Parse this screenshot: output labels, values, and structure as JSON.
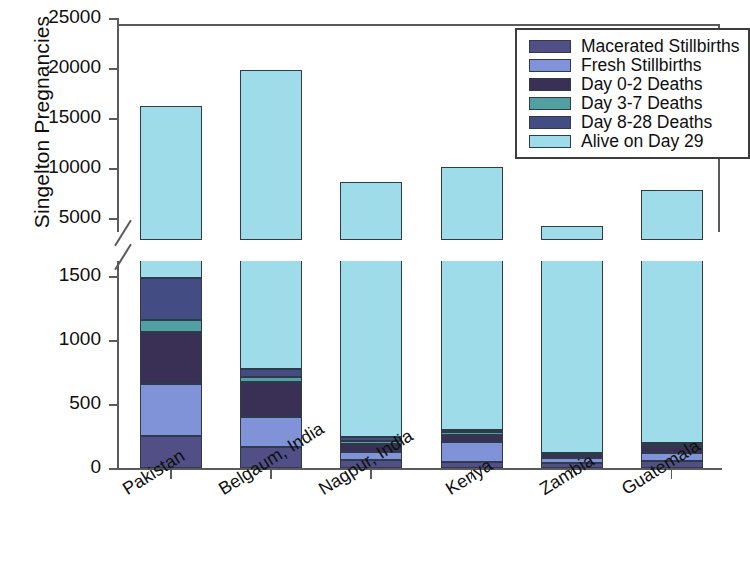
{
  "chart_data": {
    "type": "bar",
    "title": "",
    "subtitle": "",
    "xlabel": "",
    "ylabel": "Singelton Pregnancies",
    "stacked": true,
    "broken_axis": true,
    "grid": false,
    "legend_position": "top-right",
    "lower_panel": {
      "ylim": [
        0,
        1620
      ],
      "ticks": [
        0,
        500,
        1000,
        1500
      ],
      "ticklabels": [
        "0",
        "500",
        "1000",
        "1500"
      ]
    },
    "upper_panel": {
      "ylim": [
        4000,
        25000
      ],
      "ticks": [
        5000,
        10000,
        15000,
        20000,
        25000
      ],
      "ticklabels": [
        "5000",
        "10000",
        "15000",
        "20000",
        "25000"
      ]
    },
    "categories": [
      "Pakistan",
      "Belgaum, India",
      "Nagpur, India",
      "Kenya",
      "Zambia",
      "Guatemala"
    ],
    "series": [
      {
        "name": "Macerated Stillbirths",
        "color": "#514f86",
        "values": [
          248,
          163,
          61,
          48,
          36,
          56
        ]
      },
      {
        "name": "Fresh Stillbirths",
        "color": "#8193d8",
        "values": [
          412,
          239,
          68,
          152,
          42,
          58
        ]
      },
      {
        "name": "Day 0-2 Deaths",
        "color": "#3a2f54",
        "values": [
          401,
          269,
          62,
          62,
          27,
          47
        ]
      },
      {
        "name": "Day 3-7 Deaths",
        "color": "#53a0a2",
        "values": [
          95,
          42,
          22,
          16,
          7,
          16
        ]
      },
      {
        "name": "Day 8-28 Deaths",
        "color": "#434c83",
        "values": [
          331,
          65,
          30,
          16,
          7,
          22
        ]
      },
      {
        "name": "Alive on Day 29",
        "color": "#9fdcea",
        "values": [
          16200,
          19800,
          8600,
          10100,
          4200,
          7800
        ]
      }
    ],
    "totals": [
      17687,
      20578,
      8843,
      10394,
      4319,
      7999
    ]
  },
  "legend": {
    "items": [
      {
        "label": "Macerated Stillbirths",
        "color": "#514f86"
      },
      {
        "label": "Fresh Stillbirths",
        "color": "#8193d8"
      },
      {
        "label": "Day 0-2 Deaths",
        "color": "#3a2f54"
      },
      {
        "label": "Day 3-7 Deaths",
        "color": "#53a0a2"
      },
      {
        "label": "Day 8-28 Deaths",
        "color": "#434c83"
      },
      {
        "label": "Alive on Day 29",
        "color": "#9fdcea"
      }
    ]
  }
}
